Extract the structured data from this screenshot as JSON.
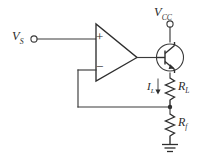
{
  "diagram": {
    "background_color": "#ffffff",
    "line_color": "#2e2e2e",
    "labels": {
      "source_voltage": "V",
      "source_voltage_sub": "S",
      "supply_voltage": "V",
      "supply_voltage_sub": "CC",
      "load_resistor": "R",
      "load_resistor_sub": "L",
      "feedback_resistor": "R",
      "feedback_resistor_sub": "f",
      "load_current": "I",
      "load_current_sub": "L",
      "opamp_noninverting": "+",
      "opamp_inverting": "−"
    },
    "components": [
      {
        "name": "input-terminal",
        "type": "terminal",
        "label": "V_S"
      },
      {
        "name": "supply-terminal",
        "type": "terminal",
        "label": "V_CC"
      },
      {
        "name": "operational-amplifier",
        "type": "opamp",
        "inputs": [
          "+",
          "−"
        ]
      },
      {
        "name": "npn-transistor",
        "type": "bjt-npn",
        "terminals": [
          "base",
          "collector",
          "emitter"
        ]
      },
      {
        "name": "load-resistor",
        "type": "resistor",
        "label": "R_L"
      },
      {
        "name": "feedback-resistor",
        "type": "resistor",
        "label": "R_f"
      },
      {
        "name": "ground",
        "type": "ground"
      },
      {
        "name": "feedback-wire",
        "type": "wire"
      },
      {
        "name": "load-current-arrow",
        "type": "current-arrow",
        "label": "I_L",
        "direction": "down"
      }
    ]
  }
}
